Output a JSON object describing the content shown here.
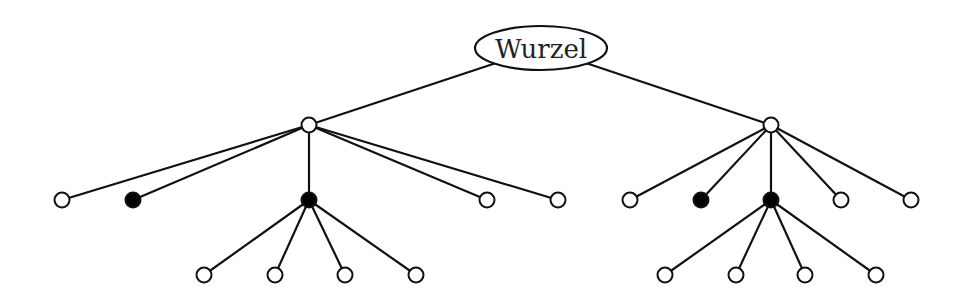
{
  "diagram": {
    "type": "tree",
    "root": {
      "id": "root",
      "label": "Wurzel",
      "cx": 541,
      "cy": 48,
      "rx": 66,
      "ry": 22
    },
    "nodes": [
      {
        "id": "L",
        "x": 309,
        "y": 125,
        "filled": false
      },
      {
        "id": "R",
        "x": 771,
        "y": 125,
        "filled": false
      },
      {
        "id": "L1",
        "x": 62,
        "y": 200,
        "filled": false
      },
      {
        "id": "L2",
        "x": 133,
        "y": 200,
        "filled": true
      },
      {
        "id": "L3",
        "x": 309,
        "y": 200,
        "filled": true
      },
      {
        "id": "L4",
        "x": 487,
        "y": 200,
        "filled": false
      },
      {
        "id": "L5",
        "x": 558,
        "y": 200,
        "filled": false
      },
      {
        "id": "L3a",
        "x": 204,
        "y": 275,
        "filled": false
      },
      {
        "id": "L3b",
        "x": 275,
        "y": 275,
        "filled": false
      },
      {
        "id": "L3c",
        "x": 345,
        "y": 275,
        "filled": false
      },
      {
        "id": "L3d",
        "x": 416,
        "y": 275,
        "filled": false
      },
      {
        "id": "R1",
        "x": 630,
        "y": 200,
        "filled": false
      },
      {
        "id": "R2",
        "x": 701,
        "y": 200,
        "filled": true
      },
      {
        "id": "R3",
        "x": 771,
        "y": 200,
        "filled": true
      },
      {
        "id": "R4",
        "x": 841,
        "y": 200,
        "filled": false
      },
      {
        "id": "R5",
        "x": 911,
        "y": 200,
        "filled": false
      },
      {
        "id": "R3a",
        "x": 665,
        "y": 275,
        "filled": false
      },
      {
        "id": "R3b",
        "x": 736,
        "y": 275,
        "filled": false
      },
      {
        "id": "R3c",
        "x": 805,
        "y": 275,
        "filled": false
      },
      {
        "id": "R3d",
        "x": 876,
        "y": 275,
        "filled": false
      }
    ],
    "edges": [
      [
        "root",
        "L"
      ],
      [
        "root",
        "R"
      ],
      [
        "L",
        "L1"
      ],
      [
        "L",
        "L2"
      ],
      [
        "L",
        "L3"
      ],
      [
        "L",
        "L4"
      ],
      [
        "L",
        "L5"
      ],
      [
        "L3",
        "L3a"
      ],
      [
        "L3",
        "L3b"
      ],
      [
        "L3",
        "L3c"
      ],
      [
        "L3",
        "L3d"
      ],
      [
        "R",
        "R1"
      ],
      [
        "R",
        "R2"
      ],
      [
        "R",
        "R3"
      ],
      [
        "R",
        "R4"
      ],
      [
        "R",
        "R5"
      ],
      [
        "R3",
        "R3a"
      ],
      [
        "R3",
        "R3b"
      ],
      [
        "R3",
        "R3c"
      ],
      [
        "R3",
        "R3d"
      ]
    ],
    "node_radius": 7.5
  }
}
